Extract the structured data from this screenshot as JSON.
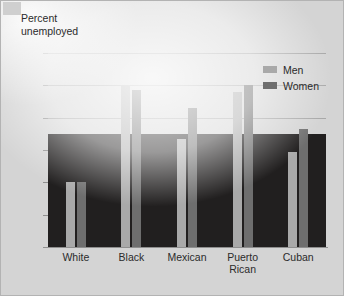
{
  "chart_data": {
    "type": "bar",
    "title": "Percent\nunemployed",
    "xlabel": "",
    "ylabel": "Percent unemployed",
    "ylim": [
      0,
      12
    ],
    "yticks": [
      0,
      2,
      4,
      6,
      8,
      10,
      12
    ],
    "ytick_labels": [
      "0",
      "2",
      "4",
      "6",
      "8",
      "10",
      "12"
    ],
    "grid": true,
    "legend_position": "top-right",
    "categories": [
      "White",
      "Black",
      "Mexican",
      "Puerto\nRican",
      "Cuban"
    ],
    "series": [
      {
        "name": "Men",
        "color": "#a9a9a9",
        "values": [
          4.0,
          10.0,
          6.7,
          9.6,
          5.9
        ]
      },
      {
        "name": "Women",
        "color": "#6e6e6e",
        "values": [
          4.0,
          9.7,
          8.6,
          10.0,
          7.3
        ]
      }
    ],
    "annotations": [
      "A dark rectangular scan artifact covers the plot area from 0 to about 7 on the y-axis"
    ]
  },
  "legend": {
    "items": [
      {
        "label": "Men",
        "color": "#a9a9a9"
      },
      {
        "label": "Women",
        "color": "#6e6e6e"
      }
    ]
  },
  "colors": {
    "men": "#a9a9a9",
    "women": "#6e6e6e",
    "background": "#d4d4d4",
    "gridline": "#a8a8a8",
    "text": "#2b2b2b",
    "artifact_band": "#211f1f"
  }
}
